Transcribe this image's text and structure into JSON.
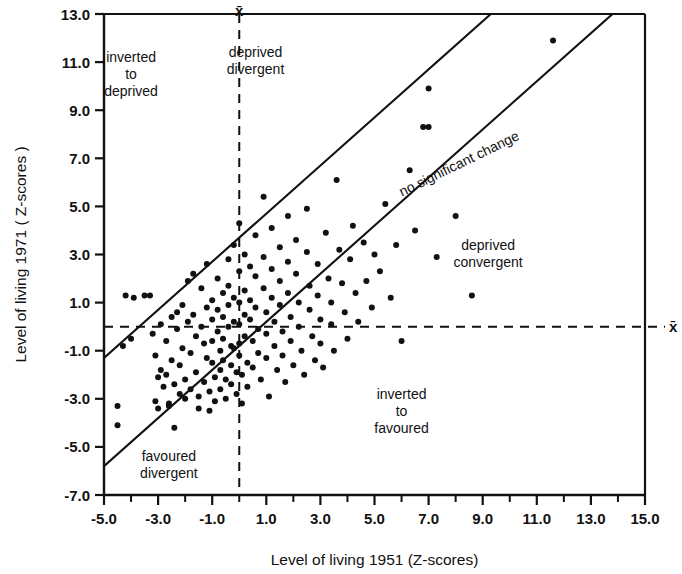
{
  "chart_data": {
    "type": "scatter",
    "title": "",
    "xlabel": "Level of living 1951 (Z-scores)",
    "ylabel": "Level of living 1971 ( Z-scores )",
    "xlim": [
      -5.0,
      15.0
    ],
    "ylim": [
      -7.0,
      13.0
    ],
    "xticks": [
      -5.0,
      -3.0,
      -1.0,
      1.0,
      3.0,
      5.0,
      7.0,
      9.0,
      11.0,
      13.0,
      15.0
    ],
    "xtick_labels": [
      "-5.0",
      "-3.0",
      "-1.0",
      "1.0",
      "3.0",
      "5.0",
      "7.0",
      "9.0",
      "11.0",
      "13.0",
      "15.0"
    ],
    "yticks": [
      -7.0,
      -5.0,
      -3.0,
      -1.0,
      1.0,
      3.0,
      5.0,
      7.0,
      9.0,
      11.0,
      13.0
    ],
    "ytick_labels": [
      "-7.0",
      "-5.0",
      "-3.0",
      "-1.0",
      "1.0",
      "3.0",
      "5.0",
      "7.0",
      "9.0",
      "11.0",
      "13.0"
    ],
    "minor_ticks": true,
    "grid": false,
    "legend": null,
    "marker": {
      "shape": "circle",
      "color": "#111111",
      "size_px": 6
    },
    "reference_lines": [
      {
        "name": "mean-x-vertical",
        "type": "vertical",
        "x": 0.0,
        "style": "dashed",
        "label": "x̄"
      },
      {
        "name": "mean-y-horizontal",
        "type": "horizontal",
        "y": 0.0,
        "style": "dashed",
        "label": "x̄"
      },
      {
        "name": "upper-band",
        "type": "line",
        "slope": 1.0,
        "intercept": 3.7,
        "style": "solid"
      },
      {
        "name": "lower-band",
        "type": "line",
        "slope": 1.0,
        "intercept": -0.8,
        "style": "solid"
      }
    ],
    "annotations": [
      {
        "name": "inverted-to-deprived",
        "text": "inverted\nto\ndeprived",
        "x": -4.0,
        "y": 11.0,
        "rotation": 0
      },
      {
        "name": "deprived-divergent",
        "text": "deprived\ndivergent",
        "x": 0.6,
        "y": 11.2,
        "rotation": 0
      },
      {
        "name": "no-significant-change",
        "text": "no significant change",
        "x": 8.2,
        "y": 6.6,
        "rotation": -26
      },
      {
        "name": "deprived-convergent",
        "text": "deprived\nconvergent",
        "x": 9.2,
        "y": 3.2,
        "rotation": 0
      },
      {
        "name": "inverted-to-favoured",
        "text": "inverted\nto\nfavoured",
        "x": 6.0,
        "y": -3.0,
        "rotation": 0
      },
      {
        "name": "favoured-divergent",
        "text": "favoured\ndivergent",
        "x": -2.6,
        "y": -5.6,
        "rotation": 0
      }
    ],
    "points": [
      [
        -4.5,
        -3.3
      ],
      [
        -4.5,
        -4.1
      ],
      [
        -4.3,
        -0.8
      ],
      [
        -4.2,
        1.3
      ],
      [
        -4.0,
        -0.5
      ],
      [
        -3.9,
        1.2
      ],
      [
        -3.5,
        1.3
      ],
      [
        -3.3,
        1.3
      ],
      [
        -3.2,
        -0.3
      ],
      [
        -3.1,
        -1.2
      ],
      [
        -3.1,
        -3.1
      ],
      [
        -3.0,
        -3.4
      ],
      [
        -3.0,
        -2.1
      ],
      [
        -2.9,
        0.1
      ],
      [
        -2.9,
        -1.8
      ],
      [
        -2.8,
        -2.5
      ],
      [
        -2.7,
        -0.6
      ],
      [
        -2.7,
        -2.0
      ],
      [
        -2.6,
        -3.2
      ],
      [
        -2.6,
        -3.3
      ],
      [
        -2.5,
        0.4
      ],
      [
        -2.5,
        -1.4
      ],
      [
        -2.4,
        -2.4
      ],
      [
        -2.4,
        -4.2
      ],
      [
        -2.3,
        0.6
      ],
      [
        -2.3,
        -0.1
      ],
      [
        -2.2,
        -1.6
      ],
      [
        -2.2,
        -2.8
      ],
      [
        -2.1,
        0.9
      ],
      [
        -2.1,
        -0.9
      ],
      [
        -2.0,
        -2.2
      ],
      [
        -2.0,
        -3.0
      ],
      [
        -1.9,
        1.9
      ],
      [
        -1.9,
        0.2
      ],
      [
        -1.8,
        -1.1
      ],
      [
        -1.8,
        -2.6
      ],
      [
        -1.7,
        2.2
      ],
      [
        -1.7,
        0.5
      ],
      [
        -1.6,
        -0.4
      ],
      [
        -1.6,
        -1.9
      ],
      [
        -1.5,
        -2.9
      ],
      [
        -1.5,
        -3.4
      ],
      [
        -1.4,
        1.6
      ],
      [
        -1.4,
        0.0
      ],
      [
        -1.3,
        -0.7
      ],
      [
        -1.3,
        -2.3
      ],
      [
        -1.2,
        2.6
      ],
      [
        -1.2,
        0.8
      ],
      [
        -1.2,
        -1.3
      ],
      [
        -1.1,
        -2.7
      ],
      [
        -1.1,
        -3.5
      ],
      [
        -1.0,
        1.1
      ],
      [
        -1.0,
        0.3
      ],
      [
        -1.0,
        -0.6
      ],
      [
        -1.0,
        -1.5
      ],
      [
        -0.9,
        -2.1
      ],
      [
        -0.9,
        -3.1
      ],
      [
        -0.8,
        2.0
      ],
      [
        -0.8,
        0.7
      ],
      [
        -0.8,
        -0.2
      ],
      [
        -0.7,
        -1.0
      ],
      [
        -0.7,
        -1.8
      ],
      [
        -0.7,
        -2.6
      ],
      [
        -0.6,
        1.4
      ],
      [
        -0.6,
        0.4
      ],
      [
        -0.6,
        -0.5
      ],
      [
        -0.6,
        -1.4
      ],
      [
        -0.5,
        -2.2
      ],
      [
        -0.5,
        -3.0
      ],
      [
        -0.4,
        2.8
      ],
      [
        -0.4,
        1.7
      ],
      [
        -0.4,
        0.9
      ],
      [
        -0.4,
        0.0
      ],
      [
        -0.3,
        -0.8
      ],
      [
        -0.3,
        -1.6
      ],
      [
        -0.3,
        -2.4
      ],
      [
        -0.2,
        3.4
      ],
      [
        -0.2,
        1.2
      ],
      [
        -0.2,
        0.2
      ],
      [
        -0.2,
        -0.9
      ],
      [
        -0.1,
        -1.9
      ],
      [
        -0.1,
        -2.8
      ],
      [
        0.0,
        4.3
      ],
      [
        0.0,
        2.3
      ],
      [
        0.0,
        1.0
      ],
      [
        0.0,
        0.1
      ],
      [
        0.0,
        -0.7
      ],
      [
        0.0,
        -1.2
      ],
      [
        0.1,
        -2.0
      ],
      [
        0.1,
        -3.2
      ],
      [
        0.2,
        3.0
      ],
      [
        0.2,
        1.5
      ],
      [
        0.2,
        0.5
      ],
      [
        0.2,
        -0.4
      ],
      [
        0.3,
        -1.5
      ],
      [
        0.3,
        -2.5
      ],
      [
        0.4,
        2.5
      ],
      [
        0.4,
        1.1
      ],
      [
        0.4,
        0.3
      ],
      [
        0.5,
        -0.6
      ],
      [
        0.5,
        -1.7
      ],
      [
        0.6,
        3.8
      ],
      [
        0.6,
        2.1
      ],
      [
        0.6,
        0.8
      ],
      [
        0.7,
        -0.1
      ],
      [
        0.7,
        -1.1
      ],
      [
        0.8,
        -2.2
      ],
      [
        0.9,
        5.4
      ],
      [
        0.9,
        2.9
      ],
      [
        0.9,
        1.6
      ],
      [
        1.0,
        0.6
      ],
      [
        1.0,
        -0.3
      ],
      [
        1.0,
        -1.3
      ],
      [
        1.1,
        -2.9
      ],
      [
        1.2,
        4.1
      ],
      [
        1.2,
        2.4
      ],
      [
        1.2,
        1.2
      ],
      [
        1.3,
        0.2
      ],
      [
        1.3,
        -0.8
      ],
      [
        1.4,
        -1.8
      ],
      [
        1.5,
        3.3
      ],
      [
        1.5,
        1.9
      ],
      [
        1.5,
        0.9
      ],
      [
        1.6,
        -0.2
      ],
      [
        1.6,
        -1.2
      ],
      [
        1.7,
        -2.3
      ],
      [
        1.8,
        4.6
      ],
      [
        1.8,
        2.7
      ],
      [
        1.8,
        1.4
      ],
      [
        1.9,
        0.4
      ],
      [
        1.9,
        -0.6
      ],
      [
        2.0,
        -1.6
      ],
      [
        2.1,
        3.6
      ],
      [
        2.1,
        2.2
      ],
      [
        2.2,
        1.0
      ],
      [
        2.2,
        0.0
      ],
      [
        2.3,
        -1.0
      ],
      [
        2.4,
        -2.0
      ],
      [
        2.5,
        4.9
      ],
      [
        2.5,
        3.1
      ],
      [
        2.6,
        1.7
      ],
      [
        2.6,
        0.7
      ],
      [
        2.7,
        -0.4
      ],
      [
        2.8,
        -1.4
      ],
      [
        2.9,
        2.6
      ],
      [
        2.9,
        1.3
      ],
      [
        3.0,
        0.3
      ],
      [
        3.0,
        -0.7
      ],
      [
        3.1,
        -1.7
      ],
      [
        3.2,
        3.9
      ],
      [
        3.3,
        2.0
      ],
      [
        3.4,
        1.0
      ],
      [
        3.4,
        0.1
      ],
      [
        3.5,
        -1.0
      ],
      [
        3.6,
        6.1
      ],
      [
        3.7,
        3.2
      ],
      [
        3.8,
        1.8
      ],
      [
        3.9,
        0.6
      ],
      [
        4.0,
        -0.5
      ],
      [
        4.1,
        2.8
      ],
      [
        4.2,
        4.2
      ],
      [
        4.3,
        1.4
      ],
      [
        4.4,
        0.2
      ],
      [
        4.6,
        3.5
      ],
      [
        4.7,
        1.9
      ],
      [
        4.9,
        0.8
      ],
      [
        5.0,
        3.0
      ],
      [
        5.2,
        2.3
      ],
      [
        5.4,
        5.1
      ],
      [
        5.6,
        1.2
      ],
      [
        5.8,
        3.4
      ],
      [
        6.0,
        -0.6
      ],
      [
        6.3,
        6.5
      ],
      [
        6.5,
        4.0
      ],
      [
        6.8,
        8.3
      ],
      [
        7.0,
        9.9
      ],
      [
        7.0,
        8.3
      ],
      [
        7.3,
        2.9
      ],
      [
        8.0,
        4.6
      ],
      [
        8.6,
        1.3
      ],
      [
        11.6,
        11.9
      ]
    ]
  },
  "axes": {
    "x_title": "Level of living 1951 (Z-scores)",
    "y_title": "Level of living 1971 ( Z-scores )",
    "mean_marker": "x̄"
  }
}
